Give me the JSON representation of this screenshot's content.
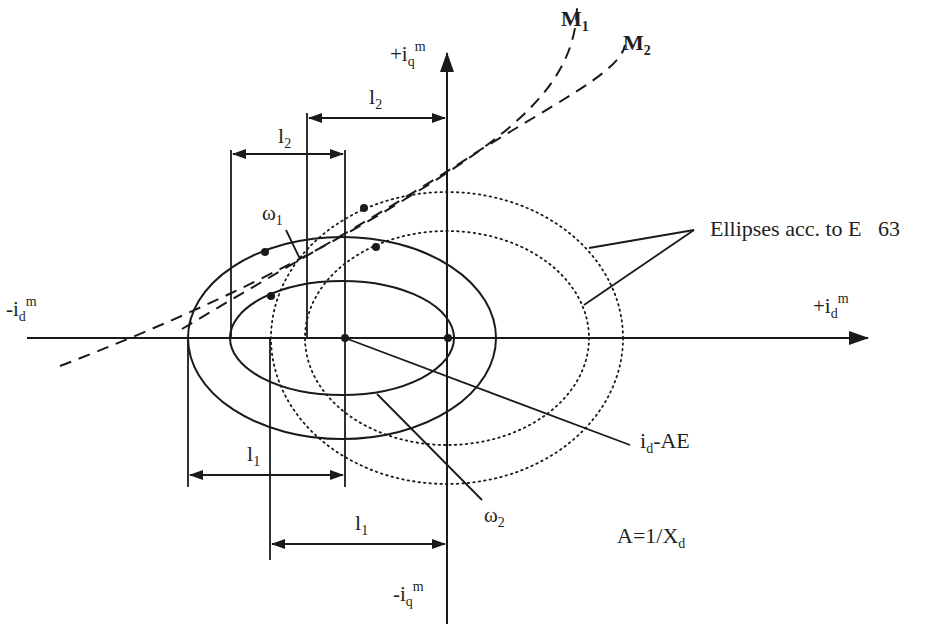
{
  "diagram": {
    "axes": {
      "horizontal": {
        "positive_label": {
          "base": "+i",
          "sub": "d",
          "sup": "m"
        },
        "negative_label": {
          "base": "-i",
          "sub": "d",
          "sup": "m"
        }
      },
      "vertical": {
        "positive_label": {
          "base": "+i",
          "sub": "q",
          "sup": "m"
        },
        "negative_label": {
          "base": "-i",
          "sub": "q",
          "sup": "m"
        }
      }
    },
    "curves": {
      "m1": {
        "base": "M",
        "sub": "1"
      },
      "m2": {
        "base": "M",
        "sub": "2"
      }
    },
    "ellipse_labels": {
      "omega1": {
        "base": "ω",
        "sub": "1"
      },
      "omega2": {
        "base": "ω",
        "sub": "2"
      },
      "dotted_annotation": "Ellipses acc. to E   63"
    },
    "dimensions": {
      "l2_upper": {
        "base": "l",
        "sub": "2"
      },
      "l2_lower": {
        "base": "l",
        "sub": "2"
      },
      "l1_upper": {
        "base": "l",
        "sub": "1"
      },
      "l1_lower": {
        "base": "l",
        "sub": "1"
      }
    },
    "annotations": {
      "id_ae": {
        "base": "i",
        "sub": "d",
        "rest": "-AE"
      },
      "a_formula": {
        "base": "A=1/X",
        "sub": "d"
      }
    },
    "colors": {
      "line": "#1a1a1a",
      "background": "#ffffff"
    }
  }
}
